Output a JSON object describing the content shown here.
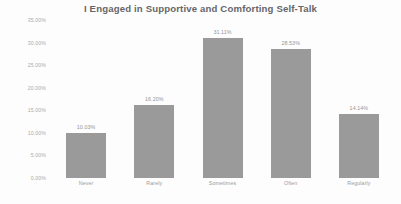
{
  "chart_data": {
    "type": "bar",
    "title": "I Engaged in Supportive and Comforting Self-Talk",
    "xlabel": "",
    "ylabel": "",
    "categories": [
      "Never",
      "Rarely",
      "Sometimes",
      "Often",
      "Regularly"
    ],
    "values": [
      10.03,
      16.2,
      31.11,
      28.53,
      14.14
    ],
    "value_labels": [
      "10.03%",
      "16.20%",
      "31.11%",
      "28.53%",
      "14.14%"
    ],
    "ylim": [
      0,
      35
    ],
    "ytick_labels": [
      "0.00%",
      "5.00%",
      "10.00%",
      "15.00%",
      "20.00%",
      "25.00%",
      "30.00%",
      "35.00%"
    ],
    "ytick_values": [
      0,
      5,
      10,
      15,
      20,
      25,
      30,
      35
    ],
    "grid": false,
    "legend": "none",
    "bar_color": "#9a9a9a",
    "text_color": "#8e8e91",
    "title_color": "#59595c",
    "background": "#ffffff"
  },
  "footer": {
    "clipped_text": " "
  }
}
